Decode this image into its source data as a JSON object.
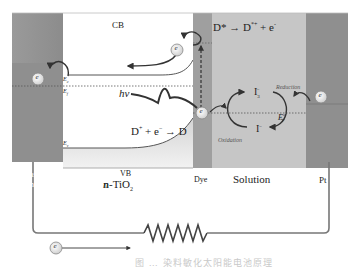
{
  "diagram": {
    "regions": {
      "transparent_conductor": "Transparent Conductor",
      "tio2_label": "n-TiO",
      "tio2_sub": "2",
      "vb": "VB",
      "cb": "CB",
      "dye": "Dye",
      "solution": "Solution",
      "pt": "Pt"
    },
    "levels": {
      "ec": "E",
      "ec_sub": "c",
      "ef": "E",
      "ef_sub": "f",
      "ev": "E",
      "ev_sub": "v",
      "redox": "E",
      "redox_sup": "o",
      "redox_sub": "F"
    },
    "equations": {
      "excitation_left": "D* → D",
      "excitation_sup": "*+",
      "excitation_right": " + e",
      "excitation_e_sup": "-",
      "regeneration_left": "D",
      "regeneration_sup": "+",
      "regeneration_mid": " + e",
      "regeneration_e_sup": "−",
      "regeneration_right": " → D"
    },
    "photon": "hv",
    "redox_species": {
      "oxidized": "I",
      "oxidized_sub": "3",
      "oxidized_sup": "−",
      "reduced": "I",
      "reduced_sup": "−"
    },
    "processes": {
      "reduction": "Reduction",
      "oxidation": "Oxidation"
    },
    "electron_symbol": "e",
    "caption": "图 … 染料敏化太阳能电池原理"
  }
}
